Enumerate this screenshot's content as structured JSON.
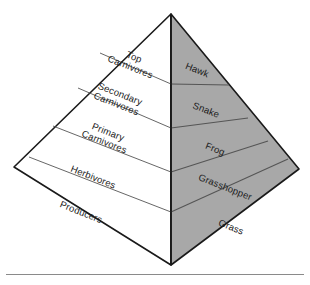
{
  "figure": {
    "type": "energy-pyramid-diagram",
    "title": "",
    "background_color": "#ffffff",
    "outline_color": "#1a1a1a",
    "left_face_fill": "#ffffff",
    "right_face_fill": "#a8a8a8",
    "divider_color": "#555555",
    "text_color": "#1a1a1a",
    "baseline_rule_color": "#8a8a8a"
  },
  "levels": [
    {
      "index": 0,
      "position": "top",
      "trophic_label": "Top\nCarnivores",
      "trophic_label_line1": "Top",
      "trophic_label_line2": "Carnivores",
      "organism_label": "Hawk"
    },
    {
      "index": 1,
      "position": "second",
      "trophic_label": "Secondary\nCarnivores",
      "trophic_label_line1": "Secondary",
      "trophic_label_line2": "Carnivores",
      "organism_label": "Snake"
    },
    {
      "index": 2,
      "position": "third",
      "trophic_label": "Primary\nCarnivores",
      "trophic_label_line1": "Primary",
      "trophic_label_line2": "Carnivores",
      "organism_label": "Frog"
    },
    {
      "index": 3,
      "position": "fourth",
      "trophic_label": "Herbivores",
      "trophic_label_line1": "Herbivores",
      "trophic_label_line2": "",
      "organism_label": "Grasshopper"
    },
    {
      "index": 4,
      "position": "base",
      "trophic_label": "Producers",
      "trophic_label_line1": "Producers",
      "trophic_label_line2": "",
      "organism_label": "Grass"
    }
  ]
}
